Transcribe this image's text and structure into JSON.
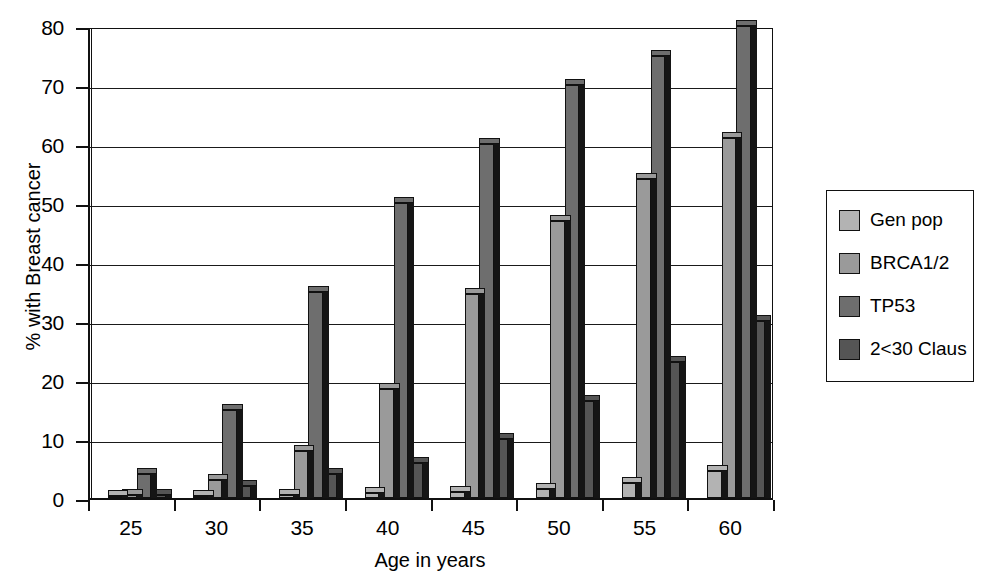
{
  "chart_data": {
    "type": "bar",
    "title": "",
    "subtitle": "",
    "xlabel": "Age in years",
    "ylabel": "% with Breast cancer",
    "categories": [
      "25",
      "30",
      "35",
      "40",
      "45",
      "50",
      "55",
      "60"
    ],
    "ylim": [
      0,
      80
    ],
    "yticks": [
      0,
      10,
      20,
      30,
      40,
      50,
      60,
      70,
      80
    ],
    "ytick_labels": [
      "0",
      "10",
      "20",
      "30",
      "40",
      "50",
      "60",
      "70",
      "80"
    ],
    "grid": "horizontal",
    "legend_position": "right",
    "series": [
      {
        "name": "Gen pop",
        "color": "#b3b3b3",
        "values": [
          0.2,
          0.3,
          0.5,
          0.8,
          1.0,
          1.5,
          2.5,
          4.5
        ]
      },
      {
        "name": "BRCA1/2",
        "color": "#9a9a9a",
        "values": [
          0.5,
          3.0,
          8.0,
          18.5,
          34.5,
          47.0,
          54.0,
          61.0
        ]
      },
      {
        "name": "TP53",
        "color": "#6e6e6e",
        "values": [
          4.0,
          15.0,
          35.0,
          50.0,
          60.0,
          70.0,
          75.0,
          80.0
        ]
      },
      {
        "name": "2<30 Claus",
        "color": "#555555",
        "values": [
          0.5,
          2.0,
          4.0,
          6.0,
          10.0,
          16.5,
          23.0,
          30.0
        ]
      }
    ]
  },
  "legend": {
    "items": [
      {
        "label": "Gen pop"
      },
      {
        "label": "BRCA1/2"
      },
      {
        "label": "TP53"
      },
      {
        "label": "2<30 Claus"
      }
    ]
  },
  "axes": {
    "y_title": "% with Breast cancer",
    "x_title": "Age in years"
  }
}
